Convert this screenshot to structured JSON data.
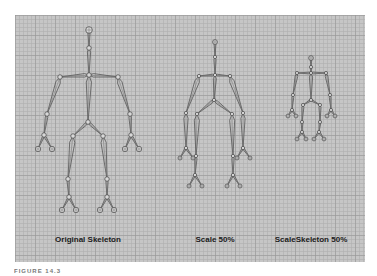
{
  "figure": {
    "labels": [
      {
        "text": "Original Skeleton",
        "x": 88
      },
      {
        "text": "Scale 50%",
        "x": 215
      },
      {
        "text": "ScaleSkeleton 50%",
        "x": 311
      }
    ],
    "caption": "FIGURE 14.3"
  },
  "colors": {
    "viewport_bg": "#c6c6c6",
    "grid_line": "#969696",
    "bone": "#555555",
    "label": "#1a1a1a"
  },
  "skeletons": [
    {
      "name": "original-skeleton",
      "joints": {
        "head": [
          89,
          30
        ],
        "neck": [
          89,
          48
        ],
        "chest": [
          89,
          75
        ],
        "l_shoulder": [
          60,
          77
        ],
        "r_shoulder": [
          118,
          77
        ],
        "l_elbow": [
          47,
          114
        ],
        "r_elbow": [
          130,
          114
        ],
        "l_wrist": [
          44,
          135
        ],
        "r_wrist": [
          131,
          135
        ],
        "l_finger1": [
          38,
          149
        ],
        "l_finger2": [
          52,
          149
        ],
        "r_finger1": [
          125,
          149
        ],
        "r_finger2": [
          139,
          149
        ],
        "pelvis": [
          88,
          122
        ],
        "l_hip": [
          73,
          136
        ],
        "r_hip": [
          103,
          136
        ],
        "l_knee": [
          68,
          179
        ],
        "r_knee": [
          107,
          179
        ],
        "l_ankle": [
          69,
          197
        ],
        "r_ankle": [
          107,
          197
        ],
        "l_foot1": [
          62,
          210
        ],
        "l_foot2": [
          76,
          210
        ],
        "r_foot1": [
          100,
          210
        ],
        "r_foot2": [
          114,
          210
        ]
      }
    },
    {
      "name": "scale-50-skeleton",
      "joints": {
        "head": [
          215,
          42
        ],
        "neck": [
          215,
          57
        ],
        "chest": [
          215,
          75
        ],
        "l_shoulder": [
          199,
          76
        ],
        "r_shoulder": [
          230,
          76
        ],
        "l_elbow": [
          186,
          113
        ],
        "r_elbow": [
          243,
          113
        ],
        "l_wrist": [
          186,
          148
        ],
        "r_wrist": [
          243,
          148
        ],
        "l_finger1": [
          180,
          158
        ],
        "l_finger2": [
          193,
          158
        ],
        "r_finger1": [
          237,
          158
        ],
        "r_finger2": [
          250,
          158
        ],
        "pelvis": [
          214,
          100
        ],
        "l_hip": [
          197,
          114
        ],
        "r_hip": [
          232,
          114
        ],
        "l_knee": [
          196,
          156
        ],
        "r_knee": [
          233,
          156
        ],
        "l_ankle": [
          195,
          175
        ],
        "r_ankle": [
          233,
          175
        ],
        "l_foot1": [
          189,
          186
        ],
        "l_foot2": [
          202,
          186
        ],
        "r_foot1": [
          227,
          186
        ],
        "r_foot2": [
          240,
          186
        ]
      }
    },
    {
      "name": "scaleskeleton-50-skeleton",
      "joints": {
        "head": [
          311,
          58
        ],
        "neck": [
          311,
          67
        ],
        "chest": [
          311,
          73
        ],
        "l_shoulder": [
          297,
          73
        ],
        "r_shoulder": [
          326,
          73
        ],
        "l_elbow": [
          293,
          95
        ],
        "r_elbow": [
          330,
          95
        ],
        "l_wrist": [
          292,
          110
        ],
        "r_wrist": [
          331,
          110
        ],
        "l_finger1": [
          288,
          116
        ],
        "l_finger2": [
          296,
          116
        ],
        "r_finger1": [
          327,
          116
        ],
        "r_finger2": [
          335,
          116
        ],
        "pelvis": [
          311,
          100
        ],
        "l_hip": [
          303,
          105
        ],
        "r_hip": [
          320,
          105
        ],
        "l_knee": [
          302,
          122
        ],
        "r_knee": [
          320,
          122
        ],
        "l_ankle": [
          302,
          132
        ],
        "r_ankle": [
          319,
          132
        ],
        "l_foot1": [
          297,
          139
        ],
        "l_foot2": [
          306,
          139
        ],
        "r_foot1": [
          314,
          139
        ],
        "r_foot2": [
          324,
          139
        ]
      }
    }
  ]
}
